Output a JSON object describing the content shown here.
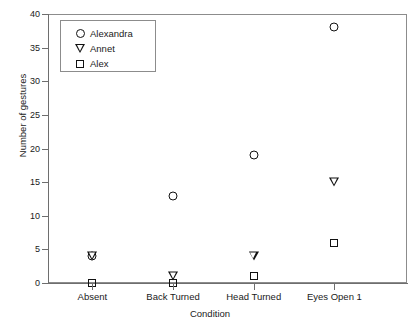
{
  "chart_data": {
    "type": "scatter",
    "title": "",
    "xlabel": "Condition",
    "ylabel": "Number of gestures",
    "categories": [
      "Absent",
      "Back Turned",
      "Head Turned",
      "Eyes Open 1"
    ],
    "ylim": [
      0,
      40
    ],
    "yticks": [
      0,
      5,
      10,
      15,
      20,
      25,
      30,
      35,
      40
    ],
    "ytick_labels": [
      "0",
      "5",
      "10",
      "15",
      "20",
      "25",
      "30",
      "35",
      "40"
    ],
    "grid": false,
    "legend_position": "upper left",
    "series": [
      {
        "name": "Alexandra",
        "marker": "circle",
        "values": [
          4,
          13,
          19,
          38
        ]
      },
      {
        "name": "Annet",
        "marker": "triangle-down",
        "values": [
          4,
          1,
          4,
          15
        ]
      },
      {
        "name": "Alex",
        "marker": "square",
        "values": [
          0,
          0,
          1,
          6
        ]
      }
    ]
  },
  "legend": {
    "items": [
      {
        "label": "Alexandra",
        "marker": "circle"
      },
      {
        "label": "Annet",
        "marker": "triangle-down"
      },
      {
        "label": "Alex",
        "marker": "square"
      }
    ]
  },
  "colors": {
    "marker": "#111111",
    "axis": "#6e6e6e",
    "frame": "#8c8c8c",
    "background": "#ffffff"
  }
}
